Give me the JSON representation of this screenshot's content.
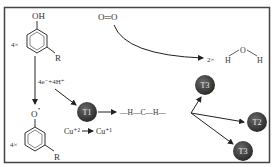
{
  "diagram": {
    "type": "reaction-mechanism",
    "colors": {
      "frame": "#444444",
      "node": "#3a3a3a",
      "line": "#222222",
      "text": "#333333"
    },
    "reactant": {
      "coefficient": "4×",
      "group_top": "OH",
      "substituent": "R"
    },
    "product": {
      "coefficient": "4×",
      "group_top": "O",
      "radical_dot": "•",
      "substituent": "R"
    },
    "electron_transfer_label": "4e⁻+4H⁺",
    "oxygen": {
      "label": "O═O"
    },
    "water": {
      "coefficient": "2×",
      "atoms": [
        "H",
        "O",
        "H"
      ]
    },
    "copper": {
      "from": "Cu⁺²",
      "to": "Cu⁺¹"
    },
    "methylene": {
      "label": "—H—C—H—"
    },
    "nodes": [
      {
        "id": "T1",
        "label": "T1"
      },
      {
        "id": "T3a",
        "label": "T3"
      },
      {
        "id": "T2",
        "label": "T2"
      },
      {
        "id": "T3b",
        "label": "T3"
      }
    ]
  }
}
